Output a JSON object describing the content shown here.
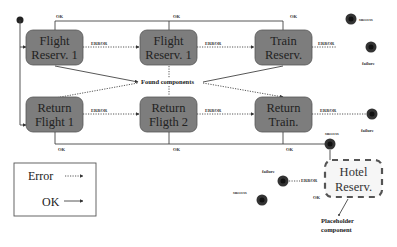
{
  "diagram": {
    "states": [
      {
        "id": "flight-reserv-1a",
        "line1": "Flight",
        "line2": "Reserv. 1"
      },
      {
        "id": "flight-reserv-1b",
        "line1": "Flight",
        "line2": "Reserv. 1"
      },
      {
        "id": "train-reserv",
        "line1": "Train",
        "line2": "Reserv."
      },
      {
        "id": "return-flight-1",
        "line1": "Return",
        "line2": "Flight 1"
      },
      {
        "id": "return-fligth-2",
        "line1": "Return",
        "line2": "Fligth 2"
      },
      {
        "id": "return-train",
        "line1": "Return",
        "line2": "Train."
      }
    ],
    "hotel": {
      "line1": "Hotel",
      "line2": "Reserv."
    },
    "labels": {
      "ok": "OK",
      "error": "ERROR",
      "success": "success",
      "failure": "failure",
      "found_components": "Found components",
      "placeholder_line1": "Placeholder",
      "placeholder_line2": "component"
    },
    "legend": {
      "error": "Error",
      "ok": "OK"
    }
  }
}
